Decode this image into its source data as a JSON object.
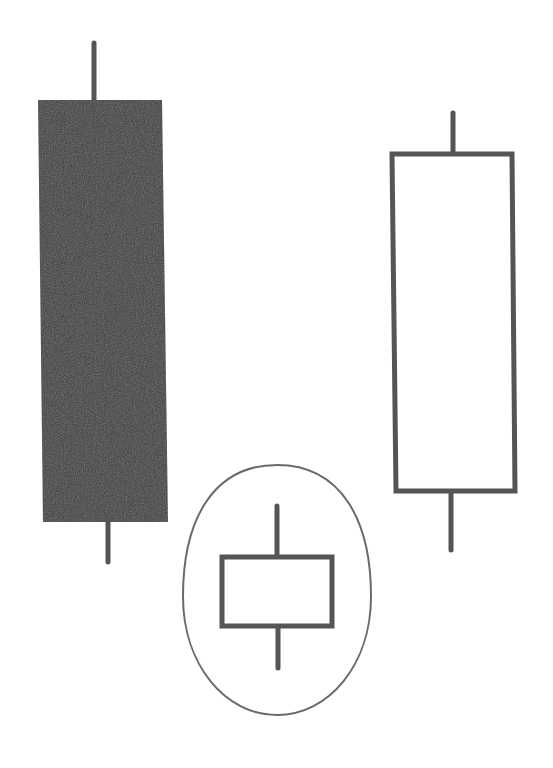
{
  "diagram": {
    "colors": {
      "background": "#ffffff",
      "bearish_fill": "#3b3b3b",
      "outline": "#555555",
      "ellipse": "#6a6a6a"
    },
    "candles": [
      {
        "id": "long-bearish",
        "type": "bearish",
        "filled": true,
        "wick_top": {
          "x": 94,
          "y1": 43,
          "y2": 100
        },
        "body": {
          "points": "38,100 162,100 168,522 43,522"
        },
        "wick_bottom": {
          "x": 108,
          "y1": 522,
          "y2": 562
        }
      },
      {
        "id": "small-star",
        "type": "small-body",
        "filled": false,
        "wick_top": {
          "x": 277,
          "y1": 506,
          "y2": 555
        },
        "body": {
          "x": 222,
          "y": 557,
          "w": 110,
          "h": 69
        },
        "wick_bottom": {
          "x": 278,
          "y1": 628,
          "y2": 668
        }
      },
      {
        "id": "long-bullish",
        "type": "bullish",
        "filled": false,
        "wick_top": {
          "x": 453,
          "y1": 113,
          "y2": 152
        },
        "body": {
          "points": "392,154 512,154 515,491 396,491"
        },
        "wick_bottom": {
          "x": 451,
          "y1": 493,
          "y2": 550
        }
      }
    ],
    "highlight": {
      "shape": "ellipse",
      "cx": 277,
      "cy": 590,
      "rx": 94,
      "ry": 125
    }
  }
}
